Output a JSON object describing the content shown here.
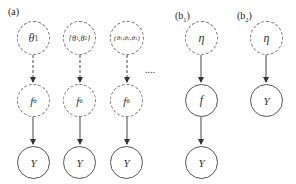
{
  "panels": {
    "a": {
      "label": "(a)",
      "columns": [
        {
          "top": "θ1",
          "mid": "fθ",
          "bottom": "Y"
        },
        {
          "top": "{θ1,θ2}",
          "mid": "fθ",
          "bottom": "Y"
        },
        {
          "top": "{θ1,θ2,θ3}",
          "mid": "fθ",
          "bottom": "Y"
        }
      ],
      "ellipsis": "....",
      "top_edge_style": "dashed",
      "bottom_edge_style": "solid"
    },
    "b1": {
      "label": "(b1)",
      "nodes": {
        "top": "η",
        "mid": "f",
        "bottom": "Y"
      }
    },
    "b2": {
      "label": "(b2)",
      "nodes": {
        "top": "η",
        "bottom": "Y"
      }
    }
  },
  "colors": {
    "stroke": "#555555",
    "dashed_stroke": "#777777",
    "text": "#222222"
  }
}
